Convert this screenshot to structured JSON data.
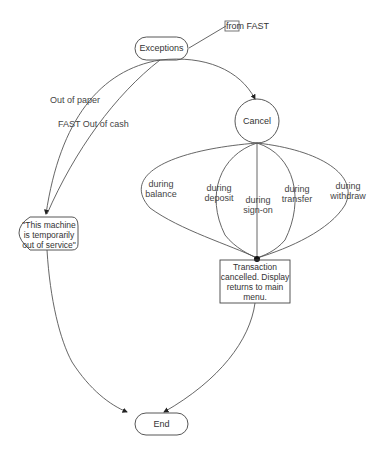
{
  "diagram": {
    "type": "statechart",
    "nodes": {
      "exceptions": {
        "label": "Exceptions",
        "shape": "rounded-rect"
      },
      "from_fast": {
        "label": "from FAST",
        "shape": "entry-box"
      },
      "cancel": {
        "label": "Cancel",
        "shape": "circle"
      },
      "out_of_service": {
        "label_lines": [
          "\"This machine",
          "is temporarily",
          "out of service\""
        ],
        "shape": "rounded"
      },
      "cancelled": {
        "label_lines": [
          "Transaction",
          "cancelled. Display",
          "returns to main",
          "menu."
        ],
        "shape": "rect"
      },
      "end": {
        "label": "End",
        "shape": "rounded-rect"
      }
    },
    "edges": [
      {
        "from": "from_fast",
        "to": "exceptions",
        "label": ""
      },
      {
        "from": "exceptions",
        "to": "out_of_service",
        "label": "Out of paper"
      },
      {
        "from": "exceptions",
        "to": "out_of_service",
        "label": "FAST Out of cash"
      },
      {
        "from": "exceptions",
        "to": "cancel",
        "label": ""
      },
      {
        "from": "cancel",
        "to": "cancelled",
        "label_lines": [
          "during",
          "balance"
        ]
      },
      {
        "from": "cancel",
        "to": "cancelled",
        "label_lines": [
          "during",
          "deposit"
        ]
      },
      {
        "from": "cancel",
        "to": "cancelled",
        "label_lines": [
          "during",
          "sign-on"
        ]
      },
      {
        "from": "cancel",
        "to": "cancelled",
        "label_lines": [
          "during",
          "transfer"
        ]
      },
      {
        "from": "cancel",
        "to": "cancelled",
        "label_lines": [
          "during",
          "withdraw"
        ]
      },
      {
        "from": "out_of_service",
        "to": "end",
        "label": ""
      },
      {
        "from": "cancelled",
        "to": "end",
        "label": ""
      }
    ]
  }
}
